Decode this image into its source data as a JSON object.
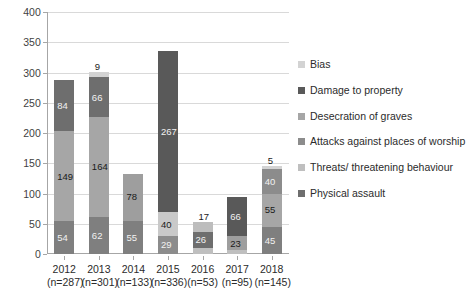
{
  "chart_data": {
    "type": "bar",
    "subtype": "stacked-bar",
    "title": "",
    "xlabel": "",
    "ylabel": "",
    "ylim": [
      0,
      400
    ],
    "ytick_step": 50,
    "yticks": [
      0,
      50,
      100,
      150,
      200,
      250,
      300,
      350,
      400
    ],
    "grid": true,
    "legend_position": "right",
    "categories": [
      "2012",
      "2013",
      "2014",
      "2015",
      "2016",
      "2017",
      "2018"
    ],
    "category_sublabels": [
      "(n=287)",
      "(n=301)",
      "(n=133)",
      "(n=336)",
      "(n=53)",
      "(n=95)",
      "(n=145)"
    ],
    "totals": [
      287,
      301,
      133,
      336,
      53,
      95,
      145
    ],
    "series": [
      {
        "name": "Bias",
        "color": "#d3d3d3",
        "values": [
          null,
          9,
          null,
          null,
          null,
          null,
          5
        ]
      },
      {
        "name": "Damage to property",
        "color": "#595959",
        "values": [
          84,
          66,
          null,
          267,
          17,
          66,
          40
        ]
      },
      {
        "name": "Desecration of graves",
        "color": "#a6a6a6",
        "values": [
          null,
          null,
          null,
          null,
          null,
          null,
          null
        ]
      },
      {
        "name": "Attacks against places of worship",
        "color": "#bfbfbf",
        "values": [
          null,
          null,
          null,
          40,
          null,
          null,
          null
        ]
      },
      {
        "name": "Threats/ threatening behaviour",
        "color": "#a6a6a6",
        "values": [
          149,
          164,
          78,
          null,
          26,
          23,
          55
        ]
      },
      {
        "name": "Physical assault",
        "color": "#7f7f7f",
        "values": [
          54,
          62,
          55,
          29,
          10,
          6,
          45
        ]
      }
    ],
    "stacks": [
      {
        "category": "2012",
        "total": 287,
        "segments": [
          {
            "label": "54",
            "value": 54,
            "color": "#7f7f7f",
            "dark": true
          },
          {
            "label": "149",
            "value": 149,
            "color": "#a6a6a6",
            "dark": false
          },
          {
            "label": "84",
            "value": 84,
            "color": "#6e6e6e",
            "dark": true
          }
        ]
      },
      {
        "category": "2013",
        "total": 301,
        "segments": [
          {
            "label": "62",
            "value": 62,
            "color": "#7f7f7f",
            "dark": true
          },
          {
            "label": "164",
            "value": 164,
            "color": "#a6a6a6",
            "dark": false
          },
          {
            "label": "66",
            "value": 66,
            "color": "#6e6e6e",
            "dark": true
          },
          {
            "label": "9",
            "value": 9,
            "color": "#d3d3d3",
            "dark": false
          }
        ]
      },
      {
        "category": "2014",
        "total": 133,
        "segments": [
          {
            "label": "55",
            "value": 55,
            "color": "#7f7f7f",
            "dark": true
          },
          {
            "label": "78",
            "value": 78,
            "color": "#9e9e9e",
            "dark": false
          }
        ]
      },
      {
        "category": "2015",
        "total": 336,
        "segments": [
          {
            "label": "29",
            "value": 29,
            "color": "#8c8c8c",
            "dark": true
          },
          {
            "label": "40",
            "value": 40,
            "color": "#c9c9c9",
            "dark": false
          },
          {
            "label": "267",
            "value": 267,
            "color": "#595959",
            "dark": true
          }
        ]
      },
      {
        "category": "2016",
        "total": 53,
        "segments": [
          {
            "label": "10",
            "value": 10,
            "color": "#bfbfbf",
            "dark": false
          },
          {
            "label": "26",
            "value": 26,
            "color": "#6e6e6e",
            "dark": true
          },
          {
            "label": "17",
            "value": 17,
            "color": "#bdbdbd",
            "dark": false
          }
        ]
      },
      {
        "category": "2017",
        "total": 95,
        "segments": [
          {
            "label": "6",
            "value": 6,
            "color": "#bfbfbf",
            "dark": false
          },
          {
            "label": "23",
            "value": 23,
            "color": "#9e9e9e",
            "dark": false
          },
          {
            "label": "66",
            "value": 66,
            "color": "#595959",
            "dark": true
          }
        ]
      },
      {
        "category": "2018",
        "total": 145,
        "segments": [
          {
            "label": "45",
            "value": 45,
            "color": "#7f7f7f",
            "dark": true
          },
          {
            "label": "55",
            "value": 55,
            "color": "#a6a6a6",
            "dark": false
          },
          {
            "label": "40",
            "value": 40,
            "color": "#8c8c8c",
            "dark": true
          },
          {
            "label": "5",
            "value": 5,
            "color": "#d3d3d3",
            "dark": false
          }
        ]
      }
    ]
  },
  "legend": {
    "items": [
      {
        "label": "Bias",
        "color": "#d3d3d3"
      },
      {
        "label": "Damage to property",
        "color": "#595959"
      },
      {
        "label": "Desecration of graves",
        "color": "#a6a6a6"
      },
      {
        "label": "Attacks against places of worship",
        "color": "#8c8c8c"
      },
      {
        "label": "Threats/ threatening behaviour",
        "color": "#bfbfbf"
      },
      {
        "label": "Physical assault",
        "color": "#6e6e6e"
      }
    ]
  }
}
